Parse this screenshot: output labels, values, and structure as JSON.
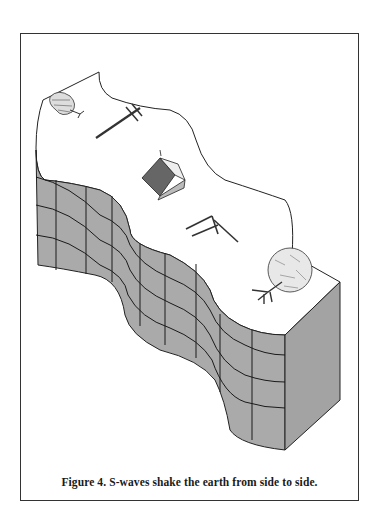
{
  "figure": {
    "number": "Figure 4.",
    "caption": "Figure 4.  S-waves shake the earth from side  to  side.",
    "elements": [
      "tree-top-left",
      "utility-pole-fallen",
      "house-tilted",
      "fence-broken",
      "tree-uprooted",
      "earth-block-wavy",
      "grid-lines"
    ]
  },
  "colors": {
    "block_fill": "#aaaaaa",
    "block_side_fill": "#a3a3a3",
    "grid_line": "#1a1a1a",
    "outline": "#222222",
    "frame_border": "#333333",
    "background": "#ffffff"
  }
}
